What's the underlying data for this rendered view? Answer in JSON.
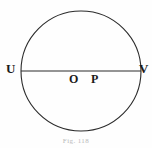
{
  "figure": {
    "caption": "Fig. 118",
    "background_color": "#fefefe",
    "stroke_color": "#2b2b2b",
    "label_color": "#1a1a1a",
    "caption_color": "#b9b9b9",
    "circle": {
      "name": "circle-outline",
      "center_x": 81,
      "center_y": 71,
      "radius": 60,
      "stroke_width": 1.1
    },
    "chord": {
      "name": "diameter-UV",
      "x1": 21,
      "y1": 71,
      "x2": 141,
      "y2": 71,
      "stroke_width": 1.2
    },
    "points": [
      {
        "id": "U",
        "label": "U",
        "role": "left-endpoint-of-diameter",
        "x": 21,
        "y": 71
      },
      {
        "id": "V",
        "label": "V",
        "role": "right-endpoint-of-diameter",
        "x": 141,
        "y": 71
      },
      {
        "id": "O",
        "label": "O",
        "role": "center-of-circle",
        "x": 81,
        "y": 71
      },
      {
        "id": "P",
        "label": "P",
        "role": "point-on-diameter",
        "x": 97,
        "y": 71
      }
    ]
  }
}
